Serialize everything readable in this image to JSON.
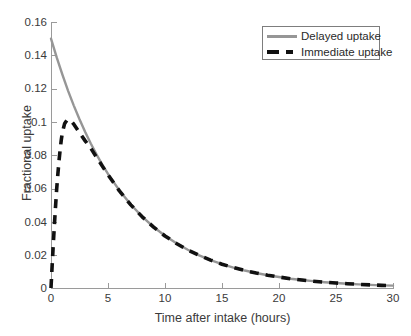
{
  "chart_data": {
    "type": "line",
    "title": "",
    "xlabel": "Time after intake (hours)",
    "ylabel": "Fractional uptake",
    "xlim": [
      0,
      30
    ],
    "ylim": [
      0,
      0.16
    ],
    "xticks": [
      "0",
      "5",
      "10",
      "15",
      "20",
      "25",
      "30"
    ],
    "xtick_values": [
      0,
      5,
      10,
      15,
      20,
      25,
      30
    ],
    "yticks": [
      "0",
      "0.02",
      "0.04",
      "0.06",
      "0.08",
      "0.1",
      "0.12",
      "0.14",
      "0.16"
    ],
    "ytick_values": [
      0,
      0.02,
      0.04,
      0.06,
      0.08,
      0.1,
      0.12,
      0.14,
      0.16
    ],
    "grid": false,
    "legend_position": "top-right",
    "series": [
      {
        "name": "Delayed uptake",
        "style": "solid",
        "color": "#969696",
        "x": [
          0,
          0.5,
          1,
          1.5,
          2,
          2.5,
          3,
          3.5,
          4,
          4.5,
          5,
          6,
          7,
          8,
          9,
          10,
          11,
          12,
          13,
          14,
          15,
          16,
          17,
          18,
          19,
          20,
          21,
          22,
          23,
          24,
          25,
          26,
          27,
          28,
          29,
          30
        ],
        "values": [
          0.15,
          0.1387,
          0.1283,
          0.1186,
          0.1097,
          0.1015,
          0.0938,
          0.0868,
          0.0802,
          0.0742,
          0.0686,
          0.0587,
          0.0502,
          0.0429,
          0.0367,
          0.0314,
          0.0269,
          0.023,
          0.0196,
          0.0168,
          0.0144,
          0.0123,
          0.0105,
          0.009,
          0.0077,
          0.0066,
          0.0056,
          0.0048,
          0.0041,
          0.0035,
          0.003,
          0.0026,
          0.0022,
          0.0019,
          0.0016,
          0.0014
        ]
      },
      {
        "name": "Immediate uptake",
        "style": "dashed",
        "color": "#111111",
        "x": [
          0,
          0.1,
          0.2,
          0.3,
          0.4,
          0.5,
          0.6,
          0.7,
          0.8,
          0.9,
          1.0,
          1.2,
          1.4,
          1.6,
          1.8,
          2.0,
          2.5,
          3,
          3.5,
          4,
          4.5,
          5,
          6,
          7,
          8,
          9,
          10,
          11,
          12,
          13,
          14,
          15,
          16,
          17,
          18,
          19,
          20,
          21,
          22,
          23,
          24,
          25,
          26,
          27,
          28,
          29,
          30
        ],
        "values": [
          0.0,
          0.0135,
          0.0263,
          0.0382,
          0.0493,
          0.0597,
          0.0683,
          0.0763,
          0.0831,
          0.089,
          0.0937,
          0.099,
          0.101,
          0.1012,
          0.1002,
          0.0985,
          0.0935,
          0.0885,
          0.084,
          0.0786,
          0.0733,
          0.0681,
          0.0584,
          0.05,
          0.0428,
          0.0366,
          0.0313,
          0.0268,
          0.0229,
          0.0196,
          0.0168,
          0.0143,
          0.0123,
          0.0105,
          0.009,
          0.0077,
          0.0066,
          0.0056,
          0.0048,
          0.0041,
          0.0035,
          0.003,
          0.0026,
          0.0022,
          0.0019,
          0.0016,
          0.0014
        ]
      }
    ]
  },
  "legend": {
    "items": [
      {
        "label": "Delayed uptake",
        "style": "solid",
        "color": "#969696"
      },
      {
        "label": "Immediate uptake",
        "style": "dashed",
        "color": "#111111"
      }
    ]
  },
  "axes": {
    "x_title": "Time after intake (hours)",
    "y_title": "Fractional uptake",
    "axis_color": "#9a9a9a"
  }
}
